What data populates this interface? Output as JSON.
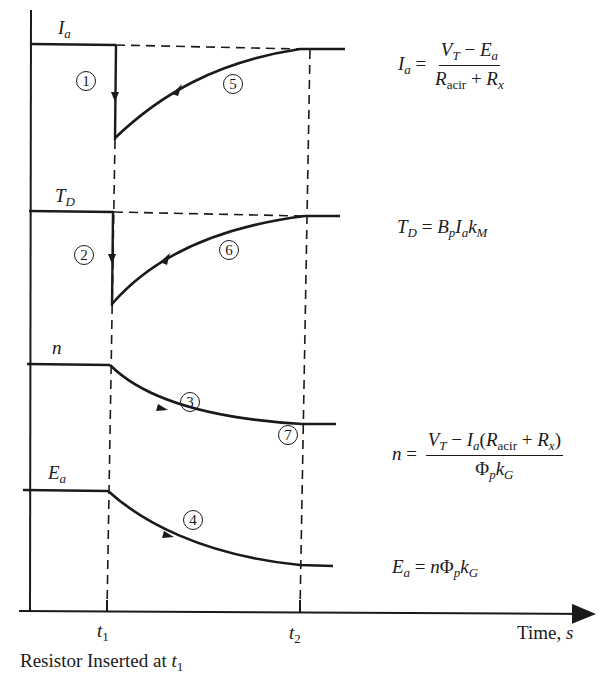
{
  "diagram": {
    "title": "",
    "caption": {
      "text": "Resistor Inserted at ",
      "symbol": "t",
      "subscript": "1"
    },
    "x_axis": {
      "label_text": "Time, ",
      "label_symbol": "s",
      "ticks": [
        {
          "symbol": "t",
          "subscript": "1"
        },
        {
          "symbol": "t",
          "subscript": "2"
        }
      ]
    },
    "curves": [
      {
        "id": "Ia",
        "label_symbol": "I",
        "label_subscript": "a",
        "steps": [
          "1",
          "5"
        ],
        "behavior": "step drop at t1, then exponential recovery to original level by t2"
      },
      {
        "id": "TD",
        "label_symbol": "T",
        "label_subscript": "D",
        "steps": [
          "2",
          "6"
        ],
        "behavior": "step drop at t1, then exponential recovery to original level by t2"
      },
      {
        "id": "n",
        "label_symbol": "n",
        "label_subscript": "",
        "steps": [
          "3",
          "7"
        ],
        "behavior": "exponential decay from t1 to new lower steady state at t2"
      },
      {
        "id": "Ea",
        "label_symbol": "E",
        "label_subscript": "a",
        "steps": [
          "4"
        ],
        "behavior": "exponential decay from t1 to new lower steady state at t2"
      }
    ],
    "step_markers": [
      "1",
      "2",
      "3",
      "4",
      "5",
      "6",
      "7"
    ],
    "equations": {
      "ia": {
        "lhs": "I",
        "lhs_sub": "a",
        "eq": "=",
        "num_a": "V",
        "num_a_sub": "T",
        "num_op": " − ",
        "num_b": "E",
        "num_b_sub": "a",
        "den_a": "R",
        "den_a_sub": "acir",
        "den_op": " + ",
        "den_b": "R",
        "den_b_sub": "x"
      },
      "td": {
        "lhs": "T",
        "lhs_sub": "D",
        "eq": " = ",
        "t1": "B",
        "t1_sub": "p",
        "t2": "I",
        "t2_sub": "a",
        "t3": "k",
        "t3_sub": "M"
      },
      "n": {
        "lhs": "n",
        "eq": "=",
        "num_a": "V",
        "num_a_sub": "T",
        "num_op": " − ",
        "num_b": "I",
        "num_b_sub": "a",
        "num_paren_open": "(",
        "num_c": "R",
        "num_c_sub": "acir",
        "num_op2": " + ",
        "num_d": "R",
        "num_d_sub": "x",
        "num_paren_close": ")",
        "den_a": "Φ",
        "den_a_sub": "p",
        "den_b": "k",
        "den_b_sub": "G"
      },
      "ea": {
        "lhs": "E",
        "lhs_sub": "a",
        "eq": " = ",
        "t1": "n",
        "t2": "Φ",
        "t2_sub": "p",
        "t3": "k",
        "t3_sub": "G"
      }
    }
  }
}
